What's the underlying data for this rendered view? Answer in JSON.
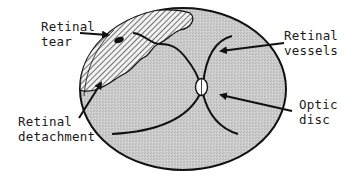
{
  "diagram": {
    "colors": {
      "background": "#ffffff",
      "fundus_fill": "#c9c9c9",
      "outline": "#111111",
      "detachment_hatch": "#3a3a3a",
      "detachment_bg": "#f2f2f2",
      "optic_disc_fill": "#ffffff"
    },
    "labels": {
      "retinal_tear": {
        "line1": "Retinal",
        "line2": "tear"
      },
      "retinal_detachment": {
        "line1": "Retinal",
        "line2": "detachment"
      },
      "retinal_vessels": {
        "line1": "Retinal",
        "line2": "vessels"
      },
      "optic_disc": {
        "line1": "Optic",
        "line2": "disc"
      }
    }
  }
}
